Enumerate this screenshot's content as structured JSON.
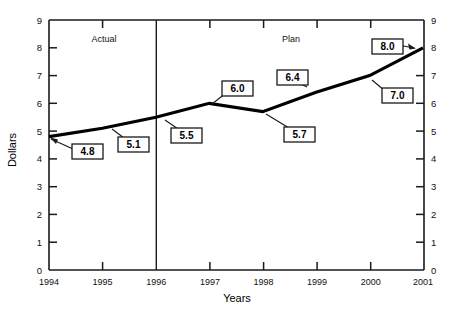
{
  "chart_data": {
    "type": "line",
    "title": "",
    "xlabel": "Years",
    "ylabel": "Dollars",
    "categories": [
      "1994",
      "1995",
      "1996",
      "1997",
      "1998",
      "1999",
      "2000",
      "2001"
    ],
    "x": [
      1994,
      1995,
      1996,
      1997,
      1998,
      1999,
      2000,
      2001
    ],
    "values": [
      4.8,
      5.1,
      5.5,
      6.0,
      5.7,
      6.4,
      7.0,
      8.0
    ],
    "point_labels": [
      "4.8",
      "5.1",
      "5.5",
      "6.0",
      "5.7",
      "6.4",
      "7.0",
      "8.0"
    ],
    "ylim": [
      0,
      9
    ],
    "xlim": [
      1994,
      2001
    ],
    "ytick_labels": [
      "9",
      "8",
      "7",
      "6",
      "5",
      "4",
      "3",
      "2",
      "1",
      "0"
    ],
    "ytick_values": [
      9,
      8,
      7,
      6,
      5,
      4,
      3,
      2,
      1,
      0
    ],
    "grid": false,
    "legend": "none",
    "dual_y_axis": true,
    "annotations": [
      {
        "name": "actual-region-label",
        "text": "Actual",
        "x": 1995.0,
        "y": 8.5
      },
      {
        "name": "plan-region-label",
        "text": "Plan",
        "x": 1998.45,
        "y": 8.5
      }
    ],
    "divider": {
      "name": "actual-plan-divider",
      "x": 1996,
      "label_left": "Actual",
      "label_right": "Plan"
    },
    "line_color": "#000000",
    "axis_color": "#1a1a1a",
    "background_color": "#ffffff"
  },
  "axes": {
    "y_left_title": "Dollars",
    "y_right_title": "",
    "x_title": "Years"
  }
}
